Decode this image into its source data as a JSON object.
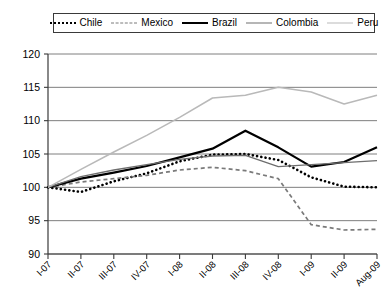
{
  "legend": {
    "position": "top",
    "items": [
      {
        "label": "Chile",
        "style": "dotted-thick",
        "color": "#000000"
      },
      {
        "label": "Mexico",
        "style": "dashed",
        "color": "#7a7a7a"
      },
      {
        "label": "Brazil",
        "style": "solid-thick",
        "color": "#000000"
      },
      {
        "label": "Colombia",
        "style": "solid",
        "color": "#6e6e6e"
      },
      {
        "label": "Peru",
        "style": "solid-light",
        "color": "#b9b9b9"
      }
    ]
  },
  "chart_data": {
    "type": "line",
    "title": "",
    "xlabel": "",
    "ylabel": "",
    "ylim": [
      90,
      120
    ],
    "yticks": [
      90,
      95,
      100,
      105,
      110,
      115,
      120
    ],
    "grid": true,
    "categories": [
      "I-07",
      "II-07",
      "III-07",
      "IV-07",
      "I-08",
      "II-08",
      "III-08",
      "IV-08",
      "I-09",
      "II-09",
      "Aug-09"
    ],
    "series": [
      {
        "name": "Chile",
        "color": "#000000",
        "style": "dotted-thick",
        "values": [
          100.0,
          99.3,
          100.9,
          102.1,
          103.9,
          104.9,
          105.0,
          104.1,
          101.5,
          100.1,
          100.0
        ]
      },
      {
        "name": "Mexico",
        "color": "#7a7a7a",
        "style": "dashed",
        "values": [
          100.0,
          100.8,
          101.3,
          101.8,
          102.6,
          103.0,
          102.5,
          101.3,
          94.4,
          93.6,
          93.7
        ]
      },
      {
        "name": "Brazil",
        "color": "#000000",
        "style": "solid-thick",
        "values": [
          100.0,
          101.3,
          102.2,
          103.2,
          104.5,
          105.8,
          108.5,
          106.0,
          103.1,
          103.8,
          106.0
        ]
      },
      {
        "name": "Colombia",
        "color": "#6e6e6e",
        "style": "solid",
        "values": [
          100.0,
          101.6,
          102.6,
          103.4,
          104.2,
          104.7,
          104.8,
          103.1,
          103.4,
          103.7,
          104.0
        ]
      },
      {
        "name": "Peru",
        "color": "#b9b9b9",
        "style": "solid-light",
        "values": [
          100.0,
          102.7,
          105.3,
          107.8,
          110.5,
          113.4,
          113.8,
          115.0,
          114.3,
          112.5,
          113.8
        ]
      }
    ]
  }
}
